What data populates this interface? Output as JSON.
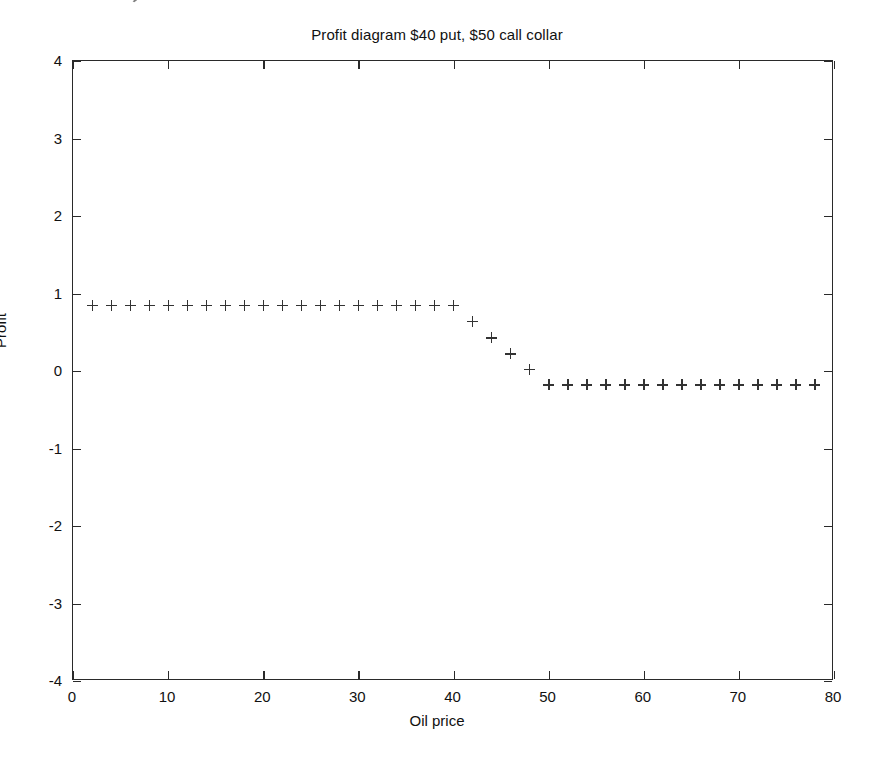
{
  "chart_data": {
    "type": "scatter",
    "title": "Profit diagram $40 put, $50 call collar",
    "xlabel": "Oil price",
    "ylabel": "Profit",
    "xlim": [
      0,
      80
    ],
    "ylim": [
      -4,
      4
    ],
    "xticks": [
      0,
      10,
      20,
      30,
      40,
      50,
      60,
      70,
      80
    ],
    "yticks": [
      -4,
      -3,
      -2,
      -1,
      0,
      1,
      2,
      3,
      4
    ],
    "xtick_labels": [
      "0",
      "10",
      "20",
      "30",
      "40",
      "50",
      "60",
      "70",
      "80"
    ],
    "ytick_labels": [
      "-4",
      "-3",
      "-2",
      "-1",
      "0",
      "1",
      "2",
      "3",
      "4"
    ],
    "grid": false,
    "legend": null,
    "marker": "+",
    "marker_color": "#333333",
    "series": [
      {
        "name": "Collar profit",
        "x": [
          2,
          4,
          6,
          8,
          10,
          12,
          14,
          16,
          18,
          20,
          22,
          24,
          26,
          28,
          30,
          32,
          34,
          36,
          38,
          40,
          42,
          44,
          46,
          48,
          50,
          52,
          54,
          56,
          58,
          60,
          62,
          64,
          66,
          68,
          70,
          72,
          74,
          76,
          78
        ],
        "y": [
          0.85,
          0.85,
          0.85,
          0.85,
          0.85,
          0.85,
          0.85,
          0.85,
          0.85,
          0.85,
          0.85,
          0.85,
          0.85,
          0.85,
          0.85,
          0.85,
          0.85,
          0.85,
          0.85,
          0.85,
          0.64,
          0.43,
          0.22,
          0.02,
          -0.18,
          -0.18,
          -0.18,
          -0.18,
          -0.18,
          -0.18,
          -0.18,
          -0.18,
          -0.18,
          -0.18,
          -0.18,
          -0.18,
          -0.18,
          -0.18,
          -0.18
        ]
      }
    ],
    "annotations": [
      {
        "text": "flat profit 0.85 below $40 put strike"
      },
      {
        "text": "linear decline between $40 and $50"
      },
      {
        "text": "flat profit -0.18 above $50 call strike"
      }
    ]
  }
}
